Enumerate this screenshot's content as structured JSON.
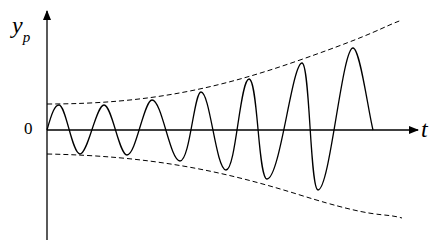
{
  "diagram": {
    "y_axis_label": "y",
    "y_axis_subscript": "p",
    "x_axis_label": "t",
    "origin_label": "0",
    "colors": {
      "curve": "#000000",
      "axis": "#000000",
      "envelope": "#000000",
      "background": "#ffffff"
    },
    "curve": {
      "description": "Sinusoid with linearly growing amplitude, bounded by dashed envelopes",
      "peaks": [
        [
          59,
          105
        ],
        [
          104,
          105
        ],
        [
          152,
          100
        ],
        [
          201,
          92
        ],
        [
          249,
          79
        ],
        [
          302,
          63
        ],
        [
          353,
          48
        ]
      ],
      "troughs": [
        [
          80,
          154
        ],
        [
          127,
          155
        ],
        [
          180,
          161
        ],
        [
          226,
          170
        ],
        [
          267,
          179
        ],
        [
          318,
          190
        ]
      ],
      "end": [
        373,
        130
      ]
    },
    "envelope_upper": "dashed curve from (47,104) rising to (402,20)",
    "envelope_lower": "dashed curve from (47,154) falling to (402,218)"
  }
}
